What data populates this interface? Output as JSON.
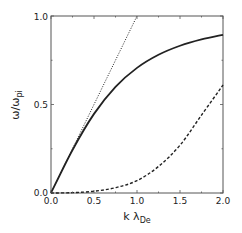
{
  "chart_data": {
    "type": "line",
    "title": "",
    "xlabel": "k λ_De",
    "ylabel": "ω/ω_pi",
    "xlim": [
      0.0,
      2.0
    ],
    "ylim": [
      0.0,
      1.0
    ],
    "grid": false,
    "legend": null,
    "x_ticks": [
      "0.0",
      "0.5",
      "1.0",
      "1.5",
      "2.0"
    ],
    "y_ticks": [
      "0.0",
      "0.5",
      "1.0"
    ],
    "x": [
      0.0,
      0.25,
      0.5,
      0.75,
      1.0,
      1.25,
      1.5,
      1.75,
      2.0
    ],
    "series": [
      {
        "name": "solid",
        "style": "solid",
        "values": [
          0.0,
          0.243,
          0.447,
          0.6,
          0.707,
          0.781,
          0.832,
          0.868,
          0.894
        ]
      },
      {
        "name": "dashed",
        "style": "dashed",
        "values": [
          0.0,
          0.002,
          0.01,
          0.03,
          0.07,
          0.15,
          0.27,
          0.44,
          0.61
        ]
      },
      {
        "name": "dotted",
        "style": "dotted",
        "x": [
          0.0,
          1.0
        ],
        "values": [
          0.0,
          1.0
        ]
      }
    ]
  },
  "labels": {
    "x_axis": "k λ",
    "x_axis_sub": "De",
    "y_axis": "ω/ω",
    "y_axis_sub": "pi",
    "x_ticks": [
      "0.0",
      "0.5",
      "1.0",
      "1.5",
      "2.0"
    ],
    "y_ticks": [
      "0.0",
      "0.5",
      "1.0"
    ]
  }
}
